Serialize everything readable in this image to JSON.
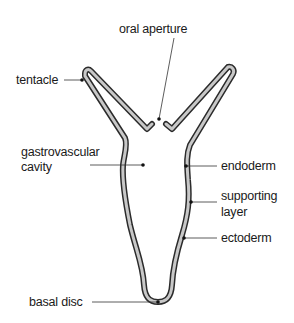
{
  "diagram": {
    "labels": {
      "oral_aperture": "oral aperture",
      "tentacle": "tentacle",
      "gastrovascular_1": "gastrovascular",
      "gastrovascular_2": "cavity",
      "endoderm": "endoderm",
      "supporting_1": "supporting",
      "supporting_2": "layer",
      "ectoderm": "ectoderm",
      "basal_disc": "basal disc"
    },
    "colors": {
      "wall_outline": "#2b2b2b",
      "wall_fill": "#c8c8c8",
      "leader_line": "#333333",
      "text": "#1a1a1a"
    }
  }
}
